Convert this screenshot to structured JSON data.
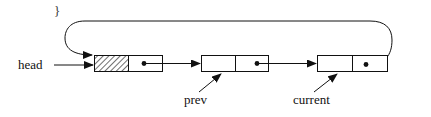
{
  "diagram": {
    "type": "circular-linked-list",
    "top_glyph": "}",
    "labels": {
      "head": "head",
      "prev": "prev",
      "current": "current"
    },
    "nodes": [
      {
        "id": "header",
        "data_cell": "hatched (dummy header)",
        "next": "node2"
      },
      {
        "id": "node2",
        "data_cell": "",
        "next": "node3",
        "pointed_by": "prev"
      },
      {
        "id": "node3",
        "data_cell": "",
        "next": "header",
        "pointed_by": "current"
      }
    ],
    "edges": [
      {
        "from": "head",
        "to": "header"
      },
      {
        "from": "header",
        "to": "node2"
      },
      {
        "from": "node2",
        "to": "node3"
      },
      {
        "from": "node3",
        "to": "header",
        "style": "loop-back over top"
      },
      {
        "from": "prev",
        "to": "node2"
      },
      {
        "from": "current",
        "to": "node3"
      }
    ],
    "colors": {
      "stroke": "#111111",
      "background": "#ffffff"
    }
  }
}
